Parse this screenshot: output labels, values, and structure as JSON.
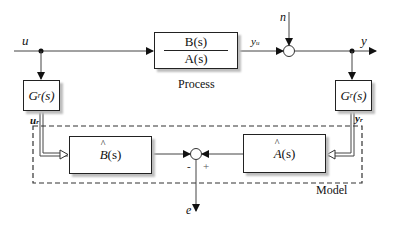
{
  "diagram": {
    "signals": {
      "u": "u",
      "y_u": "y",
      "y_u_sub": "u",
      "n": "n",
      "y": "y",
      "u_r": "u",
      "u_r_sub": "r",
      "y_r": "y",
      "y_r_sub": "r",
      "e": "e"
    },
    "blocks": {
      "process": {
        "numerator": "B(s)",
        "denominator": "A(s)",
        "caption": "Process"
      },
      "gr_left": {
        "base": "G",
        "sub": "r",
        "arg": "(s)"
      },
      "gr_right": {
        "base": "G",
        "sub": "r",
        "arg": "(s)"
      },
      "b_hat": {
        "symbol": "B",
        "arg": "(s)"
      },
      "a_hat": {
        "symbol": "A",
        "arg": "(s)"
      }
    },
    "junction_signs": {
      "minus": "-",
      "plus": "+"
    },
    "model_label": "Model",
    "colors": {
      "line": "#222222",
      "shadow": "#bdbdbd",
      "background": "#ffffff"
    }
  }
}
